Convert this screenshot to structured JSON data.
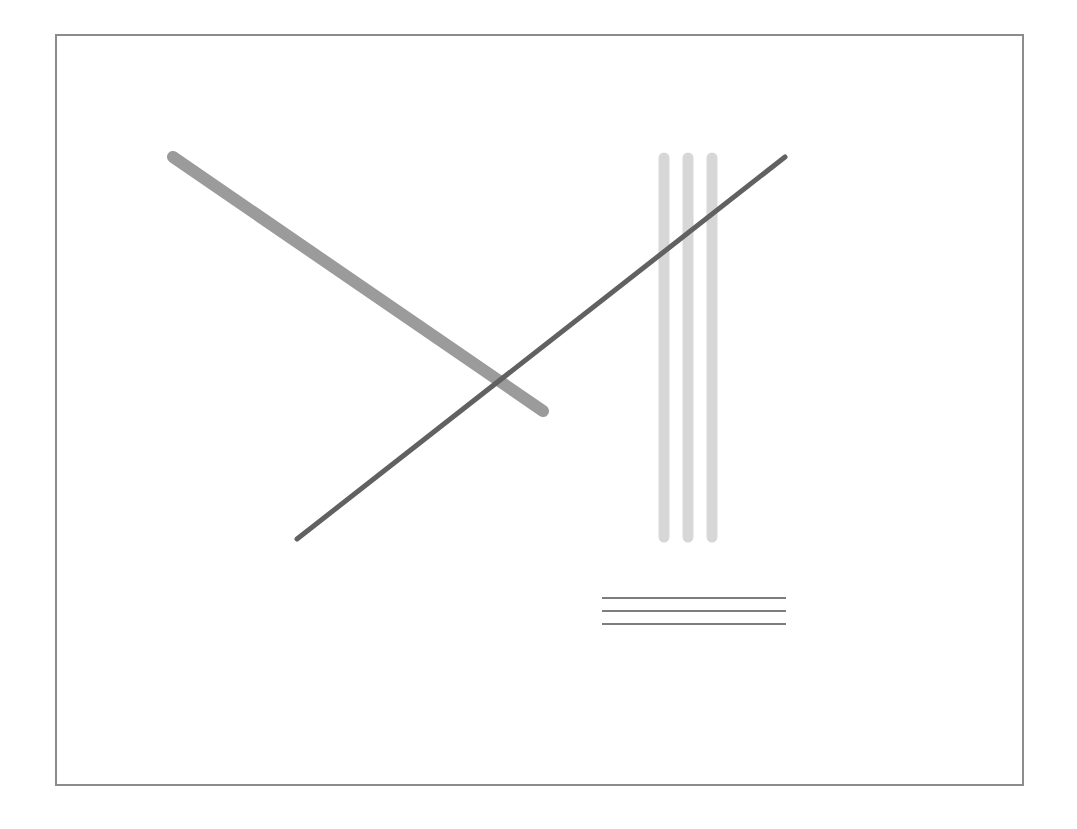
{
  "canvas": {
    "width": 1077,
    "height": 829,
    "background": "#ffffff"
  },
  "frame": {
    "x": 56,
    "y": 35,
    "width": 967,
    "height": 750,
    "stroke": "#8c8c8c",
    "stroke_width": 2
  },
  "shapes": {
    "thick_diagonal": {
      "x1": 173,
      "y1": 157,
      "x2": 543,
      "y2": 411,
      "stroke": "#9b9b9b",
      "stroke_width": 12,
      "cap": "round"
    },
    "vertical_bars": [
      {
        "x": 664,
        "y1": 158,
        "y2": 537,
        "stroke": "#d7d7d7",
        "stroke_width": 11,
        "cap": "round"
      },
      {
        "x": 688,
        "y1": 158,
        "y2": 537,
        "stroke": "#d7d7d7",
        "stroke_width": 11,
        "cap": "round"
      },
      {
        "x": 712,
        "y1": 158,
        "y2": 537,
        "stroke": "#d7d7d7",
        "stroke_width": 11,
        "cap": "round"
      }
    ],
    "thin_diagonal": {
      "x1": 297,
      "y1": 539,
      "x2": 785,
      "y2": 157,
      "stroke": "#616161",
      "stroke_width": 5,
      "cap": "round"
    },
    "horizontal_lines": [
      {
        "x1": 602,
        "x2": 786,
        "y": 598,
        "stroke": "#7d7d7d",
        "stroke_width": 2
      },
      {
        "x1": 602,
        "x2": 786,
        "y": 611,
        "stroke": "#7d7d7d",
        "stroke_width": 2
      },
      {
        "x1": 602,
        "x2": 786,
        "y": 624,
        "stroke": "#7d7d7d",
        "stroke_width": 2
      }
    ]
  }
}
